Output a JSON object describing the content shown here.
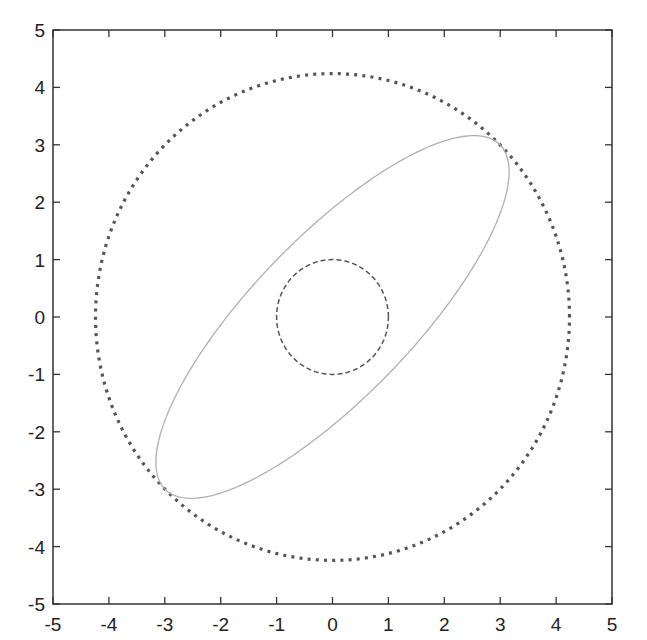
{
  "chart_data": {
    "type": "line",
    "title": "",
    "xlabel": "",
    "ylabel": "",
    "xlim": [
      -5,
      5
    ],
    "ylim": [
      -5,
      5
    ],
    "xticks": [
      -5,
      -4,
      -3,
      -2,
      -1,
      0,
      1,
      2,
      3,
      4,
      5
    ],
    "yticks": [
      -5,
      -4,
      -3,
      -2,
      -1,
      0,
      1,
      2,
      3,
      4,
      5
    ],
    "grid": false,
    "legend": null,
    "series": [
      {
        "name": "outer-circle",
        "shape": "circle",
        "center": [
          0,
          0
        ],
        "radius": 4.24,
        "style": "dotted",
        "color": "#555555"
      },
      {
        "name": "ellipse",
        "shape": "ellipse",
        "center": [
          0,
          0
        ],
        "semi_major": 4.24,
        "semi_minor": 1.41,
        "rotation_deg": 45,
        "style": "solid",
        "color": "#b0b0b0"
      },
      {
        "name": "inner-circle",
        "shape": "circle",
        "center": [
          0,
          0
        ],
        "radius": 1.0,
        "style": "dashed",
        "color": "#555555"
      }
    ]
  },
  "axes": {
    "x_tick_labels": [
      "-5",
      "-4",
      "-3",
      "-2",
      "-1",
      "0",
      "1",
      "2",
      "3",
      "4",
      "5"
    ],
    "y_tick_labels": [
      "5",
      "4",
      "3",
      "2",
      "1",
      "0",
      "-1",
      "-2",
      "-3",
      "-4",
      "-5"
    ]
  }
}
